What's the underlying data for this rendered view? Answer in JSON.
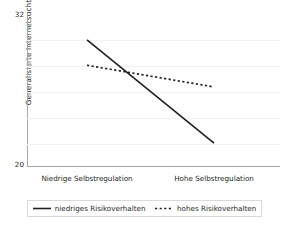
{
  "chart_data": {
    "type": "line",
    "title": "",
    "xlabel": "",
    "ylabel": "Generalisierte Internetsucht",
    "categories": [
      "Niedrige Selbstregulation",
      "Hohe Selbstregulation"
    ],
    "x": [
      0,
      1
    ],
    "ylim": [
      20,
      32
    ],
    "ytick_labels": [
      "32",
      "20"
    ],
    "ytick_values": [
      32,
      20
    ],
    "grid": "horizontal",
    "gridline_values": [
      30,
      28,
      26,
      24,
      22
    ],
    "legend_position": "bottom",
    "series": [
      {
        "name": "niedriges Risikoverhalten",
        "style": "solid",
        "color": "#231f20",
        "values": [
          29.9,
          21.8
        ]
      },
      {
        "name": "hohes Risikoverhalten",
        "style": "dotted",
        "color": "#231f20",
        "values": [
          27.9,
          26.2
        ]
      }
    ]
  },
  "axes": {
    "y_title": "Generalisierte Internetsucht",
    "y_top_label": "32",
    "y_bottom_label": "20",
    "x_category_1": "Niedrige Selbstregulation",
    "x_category_2": "Hohe Selbstregulation",
    "axis_color": "#a7a9ac",
    "grid_color": "#f2f2f2"
  },
  "legend": {
    "entry_1_label": "niedriges Risikoverhalten",
    "entry_2_label": "hohes Risikoverhalten",
    "border_color": "#d9d9d9"
  }
}
